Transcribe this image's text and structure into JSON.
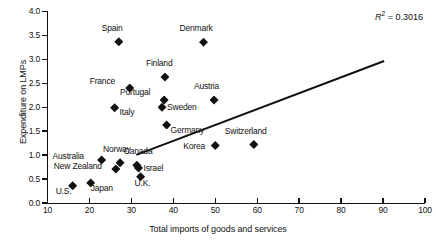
{
  "chart_data": {
    "type": "scatter",
    "title": "",
    "xlabel": "Total imports of goods and services",
    "ylabel": "Expenditure on LMPs",
    "xlim": [
      10,
      100
    ],
    "ylim": [
      0.0,
      4.0
    ],
    "xticks": [
      "10",
      "20",
      "30",
      "40",
      "50",
      "60",
      "70",
      "80",
      "90",
      "100"
    ],
    "yticks": [
      "0.0",
      "0.5",
      "1.0",
      "1.5",
      "2.0",
      "2.5",
      "3.0",
      "3.5",
      "4.0"
    ],
    "grid": false,
    "legend": "none",
    "annotation": "R2 = 0.3016",
    "annotation_r": "R",
    "annotation_exp": "2",
    "annotation_value": " = 0.3016",
    "marker": "diamond",
    "marker_color": "#111111",
    "trendline": {
      "x0": 31,
      "y0": 1.02,
      "x1": 90,
      "y1": 2.98,
      "color": "#111111"
    },
    "points": [
      {
        "label": "Spain",
        "x": 27.0,
        "y": 3.37,
        "lx": -17,
        "ly": -14
      },
      {
        "label": "Denmark",
        "x": 47.2,
        "y": 3.36,
        "lx": -24,
        "ly": -14
      },
      {
        "label": "Finland",
        "x": 38.0,
        "y": 2.63,
        "lx": -19,
        "ly": -14
      },
      {
        "label": "France",
        "x": 29.6,
        "y": 2.4,
        "lx": -40,
        "ly": -7
      },
      {
        "label": "Portugal",
        "x": 37.8,
        "y": 2.15,
        "lx": -44,
        "ly": -8
      },
      {
        "label": "Austria",
        "x": 49.7,
        "y": 2.15,
        "lx": -20,
        "ly": -14
      },
      {
        "label": "Sweden",
        "x": 37.3,
        "y": 2.0,
        "lx": 5,
        "ly": 0
      },
      {
        "label": "Italy",
        "x": 26.0,
        "y": 1.99,
        "lx": 5,
        "ly": 4
      },
      {
        "label": "Germany",
        "x": 38.4,
        "y": 1.63,
        "lx": 4,
        "ly": 5
      },
      {
        "label": "Switzerland",
        "x": 59.2,
        "y": 1.22,
        "lx": -29,
        "ly": -14
      },
      {
        "label": "Korea",
        "x": 50.0,
        "y": 1.2,
        "lx": -32,
        "ly": 0
      },
      {
        "label": "Australia",
        "x": 22.9,
        "y": 0.9,
        "lx": -49,
        "ly": -4
      },
      {
        "label": "Norway",
        "x": 27.3,
        "y": 0.84,
        "lx": -17,
        "ly": -14
      },
      {
        "label": "Canada",
        "x": 31.3,
        "y": 0.79,
        "lx": -13,
        "ly": -14
      },
      {
        "label": "New Zealand",
        "x": 26.3,
        "y": 0.71,
        "lx": -62,
        "ly": -3
      },
      {
        "label": "Israel",
        "x": 31.7,
        "y": 0.73,
        "lx": 5,
        "ly": 0
      },
      {
        "label": "U.K.",
        "x": 32.2,
        "y": 0.55,
        "lx": -6,
        "ly": 6
      },
      {
        "label": "Japan",
        "x": 20.3,
        "y": 0.42,
        "lx": 0,
        "ly": 5
      },
      {
        "label": "U.S.",
        "x": 16.0,
        "y": 0.36,
        "lx": -17,
        "ly": 5
      }
    ]
  }
}
